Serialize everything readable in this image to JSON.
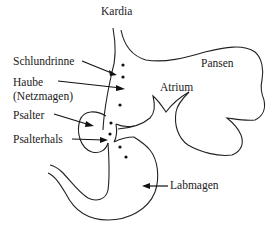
{
  "diagram": {
    "labels": {
      "kardia": "Kardia",
      "schlundrinne": "Schlundrinne",
      "haube": "Haube",
      "haube_sub": "(Netzmagen)",
      "pansen": "Pansen",
      "atrium": "Atrium",
      "psalter": "Psalter",
      "psalterhals": "Psalterhals",
      "labmagen": "Labmagen"
    },
    "colors": {
      "line": "#222222",
      "text": "#1a1a1a",
      "background": "#ffffff"
    }
  }
}
